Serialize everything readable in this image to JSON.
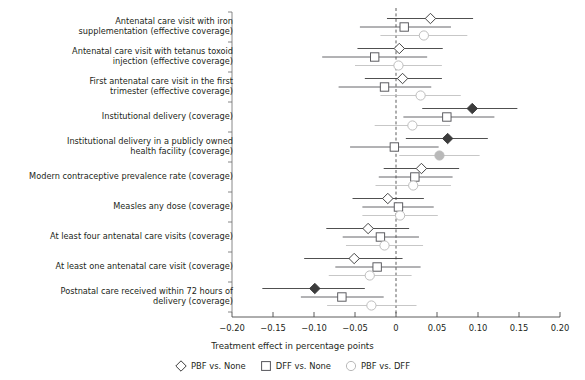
{
  "chart_data": {
    "type": "scatter",
    "title": "",
    "xlabel": "Treatment effect in percentage points",
    "ylabel": "",
    "xlim": [
      -0.2,
      0.2
    ],
    "grid": false,
    "reference_line": 0,
    "legend_position": "bottom",
    "xticks": [
      "−0.20",
      "−0.15",
      "−0.10",
      "−0.05",
      "0",
      "0.05",
      "0.10",
      "0.15",
      "0.20"
    ],
    "xtick_values": [
      -0.2,
      -0.15,
      -0.1,
      -0.05,
      0,
      0.05,
      0.1,
      0.15,
      0.2
    ],
    "categories": [
      "Antenatal care visit with iron\nsupplementation (effective coverage)",
      "Antenatal care visit with tetanus toxoid\ninjection (effective coverage)",
      "First antenatal care visit in the first\ntrimester (effective coverage)",
      "Institutional delivery (coverage)",
      "Institutional delivery in a publicly owned\nhealth facility (coverage)",
      "Modern contraceptive prevalence rate (coverage)",
      "Measles any dose (coverage)",
      "At least four antenatal care visits (coverage)",
      "At least one antenatal care visit (coverage)",
      "Postnatal care received within 72 hours of\ndelivery (coverage)"
    ],
    "series": [
      {
        "name": "PBF vs. None",
        "marker": "diamond",
        "color": "#3c3c3c",
        "values": [
          0.042,
          0.004,
          0.008,
          0.093,
          0.063,
          0.031,
          -0.01,
          -0.034,
          -0.051,
          -0.099
        ],
        "ci_low": [
          -0.011,
          -0.047,
          -0.038,
          0.032,
          0.012,
          -0.015,
          -0.053,
          -0.085,
          -0.112,
          -0.163
        ],
        "ci_high": [
          0.094,
          0.057,
          0.056,
          0.148,
          0.112,
          0.077,
          0.034,
          0.016,
          0.008,
          -0.038
        ],
        "significant": [
          false,
          false,
          false,
          true,
          true,
          false,
          false,
          false,
          false,
          true
        ]
      },
      {
        "name": "DFF vs. None",
        "marker": "square",
        "color": "#55555a",
        "values": [
          0.01,
          -0.026,
          -0.014,
          0.062,
          -0.002,
          0.023,
          0.003,
          -0.019,
          -0.023,
          -0.066
        ],
        "ci_low": [
          -0.044,
          -0.09,
          -0.07,
          0.009,
          -0.056,
          -0.021,
          -0.041,
          -0.065,
          -0.074,
          -0.116
        ],
        "ci_high": [
          0.067,
          0.038,
          0.043,
          0.12,
          0.052,
          0.069,
          0.046,
          0.028,
          0.03,
          -0.015
        ],
        "significant": [
          false,
          false,
          false,
          false,
          false,
          false,
          false,
          false,
          false,
          false
        ]
      },
      {
        "name": "PBF vs. DFF",
        "marker": "circle",
        "color": "#b9b9b9",
        "values": [
          0.034,
          0.003,
          0.03,
          0.02,
          0.053,
          0.021,
          0.005,
          -0.014,
          -0.032,
          -0.03
        ],
        "ci_low": [
          -0.019,
          -0.05,
          -0.019,
          -0.026,
          0.004,
          -0.025,
          -0.041,
          -0.061,
          -0.082,
          -0.084
        ],
        "ci_high": [
          0.087,
          0.056,
          0.079,
          0.066,
          0.102,
          0.067,
          0.051,
          0.033,
          0.019,
          0.025
        ],
        "significant": [
          false,
          false,
          false,
          false,
          true,
          false,
          false,
          false,
          false,
          false
        ]
      }
    ]
  },
  "legend": {
    "items": [
      {
        "label": "PBF vs. None",
        "marker": "diamond-marker"
      },
      {
        "label": "DFF vs. None",
        "marker": "square-marker"
      },
      {
        "label": "PBF vs. DFF",
        "marker": "circle-marker"
      }
    ]
  },
  "axis": {
    "x_title": "Treatment effect in percentage points"
  }
}
